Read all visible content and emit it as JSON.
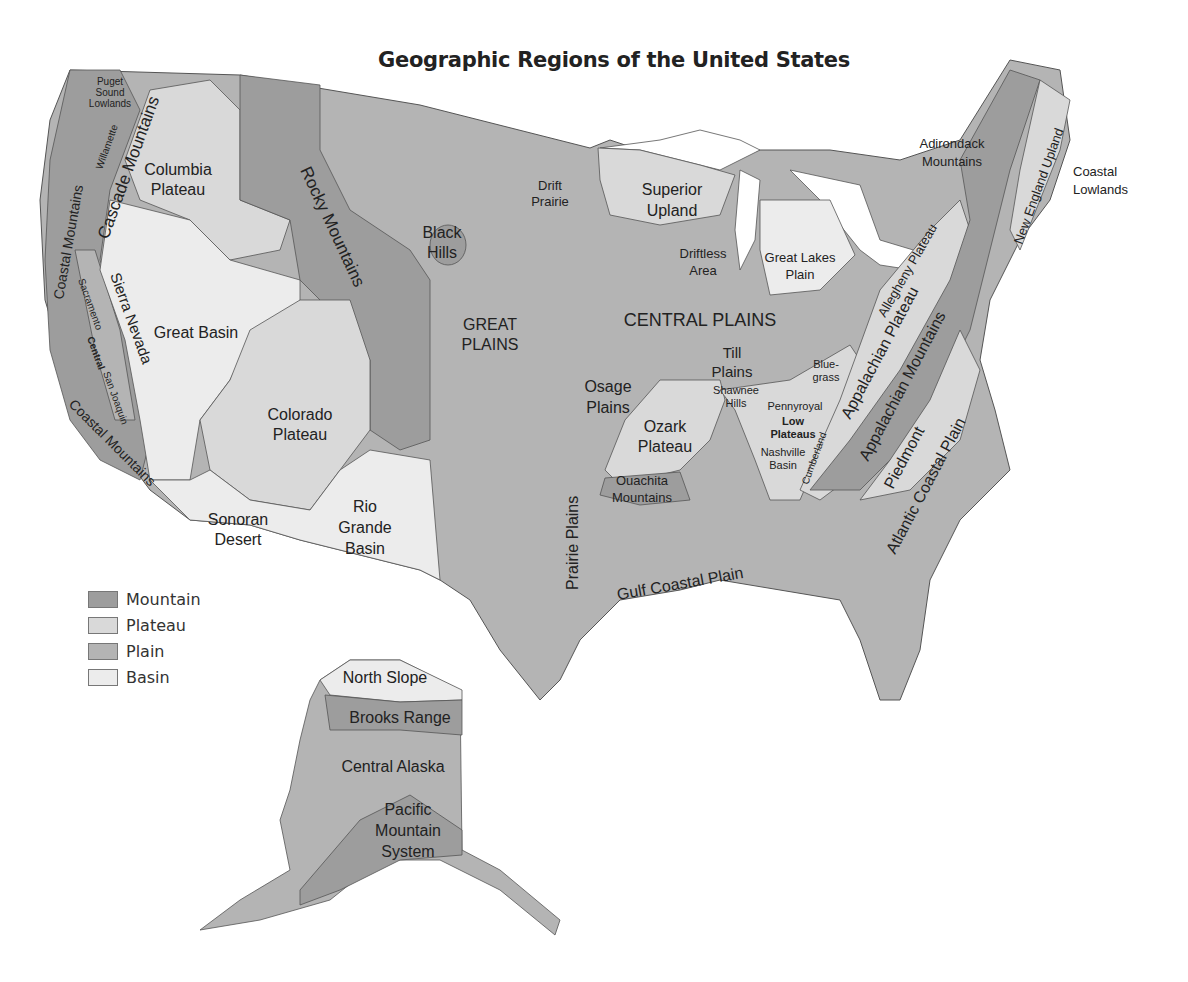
{
  "title": "Geographic Regions of the United States",
  "colors": {
    "mountain": "#9d9d9d",
    "plateau": "#d9d9d9",
    "plain": "#b4b4b4",
    "basin": "#ececec",
    "water": "#ffffff",
    "border": "#555555"
  },
  "legend": [
    {
      "label": "Mountain",
      "type": "mountain"
    },
    {
      "label": "Plateau",
      "type": "plateau"
    },
    {
      "label": "Plain",
      "type": "plain"
    },
    {
      "label": "Basin",
      "type": "basin"
    }
  ],
  "labels": {
    "puget": [
      "Puget",
      "Sound",
      "Lowlands"
    ],
    "willamette": [
      "Willamette",
      "Valley"
    ],
    "cascade": "Cascade Mountains",
    "coastal_n": "Coastal Mountains",
    "coastal_s": "Coastal Mountains",
    "columbia": [
      "Columbia",
      "Plateau"
    ],
    "rocky": "Rocky Mountains",
    "great_basin": "Great Basin",
    "sierra": "Sierra Nevada",
    "sacramento": [
      "Sacramento",
      "Valley"
    ],
    "central_valley": [
      "Central",
      "Valley"
    ],
    "san_joaquin": [
      "San Joaquin",
      "Valley"
    ],
    "colorado": [
      "Colorado",
      "Plateau"
    ],
    "sonoran": [
      "Sonoran",
      "Desert"
    ],
    "rio_grande": [
      "Rio",
      "Grande",
      "Basin"
    ],
    "black_hills": [
      "Black",
      "Hills"
    ],
    "great_plains": [
      "GREAT",
      "PLAINS"
    ],
    "drift_prairie": [
      "Drift",
      "Prairie"
    ],
    "superior": [
      "Superior",
      "Upland"
    ],
    "driftless": [
      "Driftless",
      "Area"
    ],
    "great_lakes": [
      "Great Lakes",
      "Plain"
    ],
    "central_plains": "CENTRAL PLAINS",
    "till": [
      "Till",
      "Plains"
    ],
    "osage": [
      "Osage",
      "Plains"
    ],
    "ozark": [
      "Ozark",
      "Plateau"
    ],
    "ouachita": [
      "Ouachita",
      "Mountains"
    ],
    "prairie_plains": "Prairie Plains",
    "gulf": "Gulf Coastal Plain",
    "shawnee": [
      "Shawnee",
      "Hills"
    ],
    "pennyroyal": "Pennyroyal",
    "low_plateaus": [
      "Low",
      "Plateaus"
    ],
    "nashville": [
      "Nashville",
      "Basin"
    ],
    "bluegrass": [
      "Blue-",
      "grass"
    ],
    "cumberland": [
      "Cumberland",
      "Plateau"
    ],
    "allegheny": "Allegheny Plateau",
    "appalachian_plateau": "Appalachian Plateau",
    "appalachian_mts": "Appalachian Mountains",
    "piedmont": "Piedmont",
    "atlantic": "Atlantic Coastal Plain",
    "adirondack": [
      "Adirondack",
      "Mountains"
    ],
    "new_england": "New England Upland",
    "coastal_lowlands": [
      "Coastal",
      "Lowlands"
    ],
    "north_slope": "North Slope",
    "brooks": "Brooks Range",
    "central_alaska": "Central Alaska",
    "pacific_mts": [
      "Pacific",
      "Mountain",
      "System"
    ]
  }
}
